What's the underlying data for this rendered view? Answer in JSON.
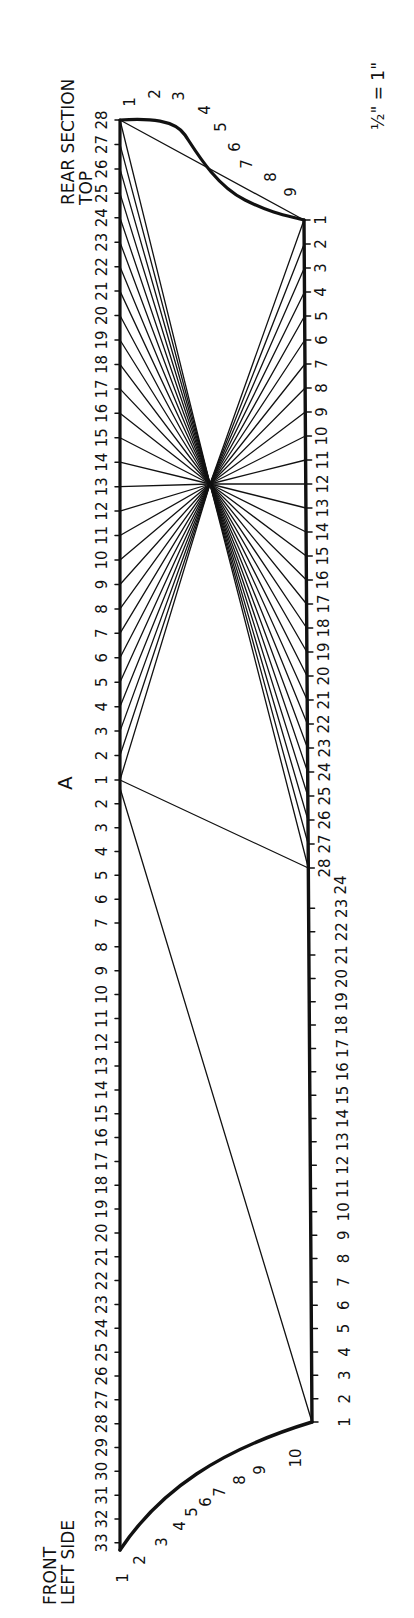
{
  "titles": {
    "top": {
      "line1": "TOP",
      "line2": "REAR SECTION"
    },
    "bottom": {
      "line1": "FRONT",
      "line2": "LEFT SIDE"
    },
    "scale": "½\" = 1\"",
    "point_a": "A"
  },
  "colors": {
    "ink": "#111111",
    "paper": "#ffffff"
  },
  "geometry": {
    "left_x": 120,
    "left_top_y": 120,
    "left_bottom_y": 1550,
    "right_top": [
      304,
      220
    ],
    "right_bottom": [
      312,
      1422
    ],
    "hub": [
      210,
      484
    ],
    "point_a": [
      120,
      780
    ]
  },
  "left_upper_labels": [
    "28",
    "27",
    "26",
    "25",
    "24",
    "23",
    "22",
    "21",
    "20",
    "19",
    "18",
    "17",
    "16",
    "15",
    "14",
    "13",
    "12",
    "11",
    "10",
    "9",
    "8",
    "7",
    "6",
    "5",
    "4",
    "3",
    "2",
    "1"
  ],
  "left_lower_labels": [
    "2",
    "3",
    "4",
    "5",
    "6",
    "7",
    "8",
    "9",
    "10",
    "11",
    "12",
    "13",
    "14",
    "15",
    "16",
    "17",
    "18",
    "19",
    "20",
    "21",
    "22",
    "23",
    "24",
    "25",
    "26",
    "27",
    "28",
    "29",
    "30",
    "31",
    "32",
    "33"
  ],
  "right_upper_labels": [
    "1",
    "2",
    "3",
    "4",
    "5",
    "6",
    "7",
    "8",
    "9",
    "10",
    "11",
    "12",
    "13",
    "14",
    "15",
    "16",
    "17",
    "18",
    "19",
    "20",
    "21",
    "22",
    "23",
    "24",
    "25",
    "26",
    "27",
    "28"
  ],
  "right_lower_labels": [
    "24",
    "23",
    "22",
    "21",
    "20",
    "19",
    "18",
    "17",
    "16",
    "15",
    "14",
    "13",
    "12",
    "11",
    "10",
    "9",
    "8",
    "7",
    "6",
    "5",
    "4",
    "3",
    "2",
    "1"
  ],
  "top_curve_labels": [
    "1",
    "2",
    "3",
    "4",
    "5",
    "6",
    "7",
    "8",
    "9"
  ],
  "bottom_curve_labels": [
    "1",
    "2",
    "3",
    "4",
    "5",
    "6",
    "7",
    "8",
    "9",
    "10"
  ]
}
